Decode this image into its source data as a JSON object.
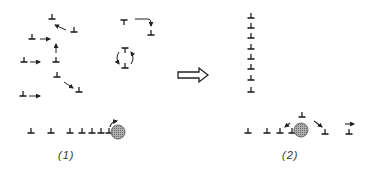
{
  "diagram": {
    "type": "dislocation-rearrangement-schematic",
    "ink_color": "#222222",
    "particle_fill": "#9a9a9a",
    "panels": [
      {
        "id": "1",
        "label": "(1)",
        "description": "Randomly distributed edge dislocations migrating (arrows), plus a dislocation pile-up row against a precipitate particle",
        "dislocations_up": [
          [
            52,
            18
          ],
          [
            80,
            31
          ],
          [
            35,
            38
          ],
          [
            57,
            50
          ],
          [
            25,
            62
          ],
          [
            57,
            62
          ],
          [
            57,
            75
          ],
          [
            80,
            91
          ],
          [
            25,
            95
          ],
          [
            32,
            128
          ],
          [
            52,
            128
          ],
          [
            70,
            128
          ],
          [
            82,
            128
          ],
          [
            92,
            128
          ],
          [
            101,
            128
          ],
          [
            110,
            128
          ]
        ],
        "dislocations_down": [
          [
            126,
            20
          ],
          [
            126,
            47
          ]
        ],
        "dislocations_up_other": [
          [
            151,
            35
          ],
          [
            126,
            67
          ]
        ],
        "particle": {
          "cx": 118,
          "cy": 132,
          "r": 7
        }
      },
      {
        "id": "2",
        "label": "(2)",
        "description": "Dislocations aligned into a vertical low-angle boundary (polygonized wall); row of dislocations bypassing the particle",
        "wall_dislocations": [
          [
            251,
            16
          ],
          [
            251,
            26
          ],
          [
            251,
            36
          ],
          [
            251,
            47
          ],
          [
            251,
            57
          ],
          [
            251,
            67
          ],
          [
            251,
            78
          ],
          [
            251,
            90
          ]
        ],
        "row_dislocations": [
          [
            247,
            129
          ],
          [
            267,
            129
          ],
          [
            280,
            129
          ],
          [
            291,
            129
          ],
          [
            323,
            131
          ],
          [
            349,
            131
          ]
        ],
        "climbed_dislocation": [
          302,
          116
        ],
        "particle": {
          "cx": 302,
          "cy": 130,
          "r": 7
        }
      }
    ],
    "transition_arrow": {
      "from_panel": "1",
      "to_panel": "2",
      "style": "hollow double-line arrow"
    }
  }
}
